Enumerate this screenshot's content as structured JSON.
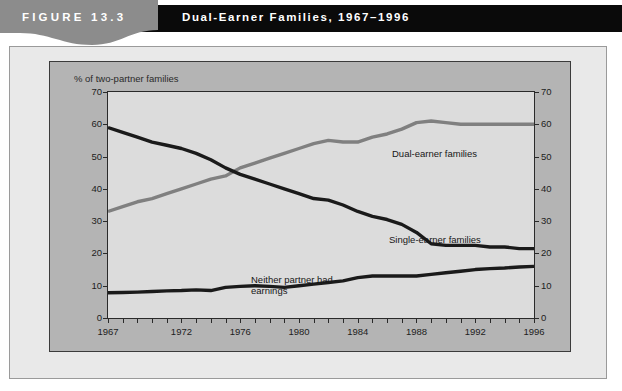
{
  "figure": {
    "number_label": "FIGURE 13.3",
    "title": "Dual-Earner Families, 1967–1996"
  },
  "colors": {
    "title_bar": "#0a0a0a",
    "figure_banner": "#8c8c8c",
    "outer_panel": "#e9e9e9",
    "chart_panel": "#b4b4b4",
    "plot_background": "#dcdcdc",
    "dual_earner_line": "#808080",
    "single_earner_line": "#1a1a1a",
    "neither_partner_line": "#1a1a1a"
  },
  "chart_data": {
    "type": "line",
    "title": "Dual-Earner Families, 1967–1996",
    "xlabel": "",
    "ylabel": "% of two-partner families",
    "ylim": [
      0,
      70
    ],
    "xlim": [
      1967,
      1996
    ],
    "grid": false,
    "legend": "inline-annotations",
    "ytick_labels": [
      "0",
      "10",
      "20",
      "30",
      "40",
      "50",
      "60",
      "70"
    ],
    "ytick_values": [
      0,
      10,
      20,
      30,
      40,
      50,
      60,
      70
    ],
    "ytick_labels_right": [
      "0",
      "10",
      "20",
      "30",
      "40",
      "50",
      "60",
      "70"
    ],
    "xtick_labels": [
      "1967",
      "1972",
      "1976",
      "1980",
      "1984",
      "1988",
      "1992",
      "1996"
    ],
    "xtick_values": [
      1967,
      1972,
      1976,
      1980,
      1984,
      1988,
      1992,
      1996
    ],
    "x": [
      1967,
      1968,
      1969,
      1970,
      1971,
      1972,
      1973,
      1974,
      1975,
      1976,
      1977,
      1978,
      1979,
      1980,
      1981,
      1982,
      1983,
      1984,
      1985,
      1986,
      1987,
      1988,
      1989,
      1990,
      1991,
      1992,
      1993,
      1994,
      1995,
      1996
    ],
    "series": [
      {
        "name": "Dual-earner families",
        "color": "#808080",
        "values": [
          33,
          34.5,
          36,
          37,
          38.5,
          40,
          41.5,
          43,
          44,
          46.5,
          48,
          49.5,
          51,
          52.5,
          54,
          55,
          54.5,
          54.5,
          56,
          57,
          58.5,
          60.5,
          61,
          60.5,
          60,
          60,
          60,
          60,
          60,
          60
        ]
      },
      {
        "name": "Single-earner families",
        "color": "#1a1a1a",
        "values": [
          59,
          57.5,
          56,
          54.5,
          53.5,
          52.5,
          51,
          49,
          46.5,
          44.5,
          43,
          41.5,
          40,
          38.5,
          37,
          36.5,
          35,
          33,
          31.5,
          30.5,
          29,
          26.5,
          23,
          22.5,
          22.5,
          22.5,
          22,
          22,
          21.5,
          21.5
        ]
      },
      {
        "name": "Neither partner had earnings",
        "color": "#1a1a1a",
        "values": [
          7.8,
          7.9,
          8,
          8.2,
          8.4,
          8.5,
          8.7,
          8.5,
          9.5,
          9.8,
          10,
          9.8,
          9.5,
          10,
          10.5,
          11,
          11.5,
          12.5,
          13,
          13,
          13,
          13,
          13.5,
          14,
          14.5,
          15,
          15.3,
          15.5,
          15.8,
          16
        ]
      }
    ],
    "annotations": [
      {
        "name": "dual-earner-label",
        "text": "Dual-earner families",
        "x": 381,
        "y": 146
      },
      {
        "name": "single-earner-label",
        "text": "Single-earner families",
        "x": 378,
        "y": 232
      },
      {
        "name": "neither-partner-label-line1",
        "text": "Neither partner had",
        "x": 240,
        "y": 272
      },
      {
        "name": "neither-partner-label-line2",
        "text": "earnings",
        "x": 240,
        "y": 283
      }
    ]
  }
}
